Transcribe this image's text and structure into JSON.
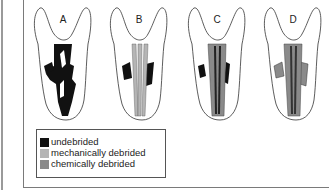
{
  "figure": {
    "panels": [
      {
        "label": "A",
        "state": "undebrided"
      },
      {
        "label": "B",
        "state": "mechanically debrided"
      },
      {
        "label": "C",
        "state": "chemically debrided"
      },
      {
        "label": "D",
        "state": "chemically debrided"
      }
    ],
    "legend": {
      "items": [
        {
          "label": "undebrided",
          "color": "#111111"
        },
        {
          "label": "mechanically debrided",
          "color": "#b5b5b5"
        },
        {
          "label": "chemically debrided",
          "color": "#8a8a8a"
        }
      ]
    }
  }
}
